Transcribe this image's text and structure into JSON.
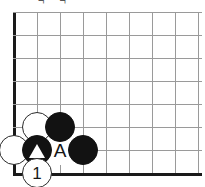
{
  "diagram": {
    "kind": "go-board-diagram",
    "caption_remnant": "¬ ¬",
    "board": {
      "width_px": 205,
      "height_px": 187,
      "cell_size_px": 23,
      "origin_x_px": 14,
      "origin_y_px": 12,
      "columns": 9,
      "rows": 8,
      "line_color": "#9a9a9a",
      "edge_color": "#1a1a1a",
      "background_color": "#ffffff",
      "left_edge_is_board_border": true,
      "bottom_edge_is_board_border": true,
      "vertical_line_x": [
        14,
        37,
        60,
        83,
        106,
        129,
        152,
        175,
        198
      ],
      "horizontal_line_y": [
        12,
        35,
        58,
        81,
        104,
        127,
        150,
        173
      ]
    },
    "stones": [
      {
        "id": "white-upper-left",
        "color": "white",
        "col": 2,
        "row": 6,
        "x": 37,
        "y": 127,
        "label": "",
        "marker": "none"
      },
      {
        "id": "black-upper-right",
        "color": "black",
        "col": 3,
        "row": 6,
        "x": 60,
        "y": 127,
        "label": "",
        "marker": "none"
      },
      {
        "id": "white-edge-left",
        "color": "white",
        "col": 1,
        "row": 7,
        "x": 14,
        "y": 150,
        "label": "",
        "marker": "none"
      },
      {
        "id": "black-triangle-marked",
        "color": "black",
        "col": 2,
        "row": 7,
        "x": 37,
        "y": 150,
        "label": "",
        "marker": "triangle"
      },
      {
        "id": "black-right",
        "color": "black",
        "col": 4,
        "row": 7,
        "x": 83,
        "y": 150,
        "label": "",
        "marker": "none"
      },
      {
        "id": "white-move-one",
        "color": "white",
        "col": 2,
        "row": 8,
        "x": 37,
        "y": 173,
        "label": "1",
        "marker": "number"
      }
    ],
    "point_labels": [
      {
        "id": "point-a",
        "text": "A",
        "col": 3,
        "row": 7,
        "x": 60,
        "y": 150
      }
    ]
  }
}
